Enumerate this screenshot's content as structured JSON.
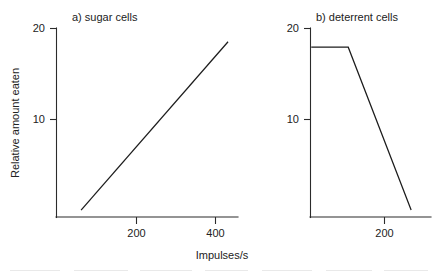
{
  "figure": {
    "axis_title_x": "Impulses/s",
    "axis_title_y": "Relative amount eaten"
  },
  "panels": {
    "left": {
      "title": "a) sugar cells",
      "y_ticks": [
        "20",
        "10"
      ],
      "x_ticks": [
        "200",
        "400"
      ]
    },
    "right": {
      "title": "b) deterrent cells",
      "y_ticks": [
        "20",
        "10"
      ],
      "x_ticks": [
        "200"
      ]
    }
  },
  "chart_data": [
    {
      "type": "line",
      "title": "a) sugar cells",
      "xlabel": "Impulses/s",
      "ylabel": "Relative amount eaten",
      "xlim": [
        0,
        470
      ],
      "ylim": [
        0,
        21
      ],
      "xticks": [
        200,
        400
      ],
      "yticks": [
        10,
        20
      ],
      "grid": false,
      "legend": "none",
      "series": [
        {
          "name": "sugar cells response",
          "x": [
            61,
            433
          ],
          "y": [
            0,
            18.5
          ]
        }
      ]
    },
    {
      "type": "line",
      "title": "b) deterrent cells",
      "xlabel": "Impulses/s",
      "ylabel": "Relative amount eaten",
      "xlim": [
        0,
        325
      ],
      "ylim": [
        0,
        21
      ],
      "xticks": [
        200
      ],
      "yticks": [
        10,
        20
      ],
      "grid": false,
      "legend": "none",
      "series": [
        {
          "name": "deterrent cells response",
          "x": [
            2,
            102,
            272
          ],
          "y": [
            17.9,
            17.9,
            0
          ]
        }
      ]
    }
  ]
}
